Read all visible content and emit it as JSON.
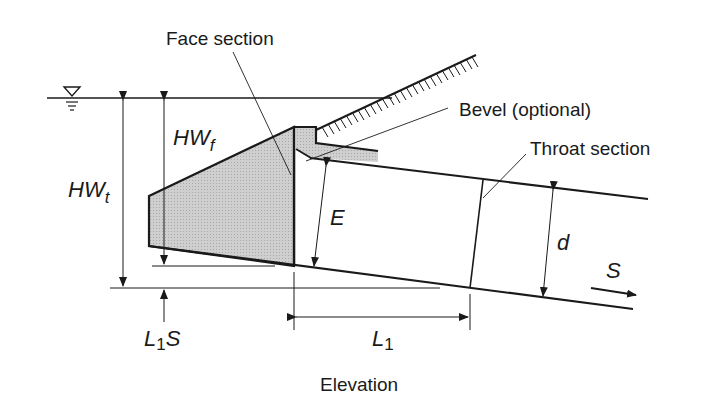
{
  "diagram": {
    "title": "Elevation",
    "labels": {
      "face_section": "Face section",
      "bevel": "Bevel (optional)",
      "throat_section": "Throat section",
      "hw_t_main": "HW",
      "hw_t_sub": "t",
      "hw_f_main": "HW",
      "hw_f_sub": "f",
      "e": "E",
      "d": "d",
      "s": "S",
      "l1_main": "L",
      "l1_sub": "1",
      "l1s_main": "L",
      "l1s_sub": "1",
      "l1s_tail": "S"
    },
    "symbols": {
      "water_surface": "water-surface-triangle-icon"
    },
    "colors": {
      "line": "#1a1a1a",
      "fill": "#c8c8c8",
      "background": "#ffffff"
    }
  }
}
